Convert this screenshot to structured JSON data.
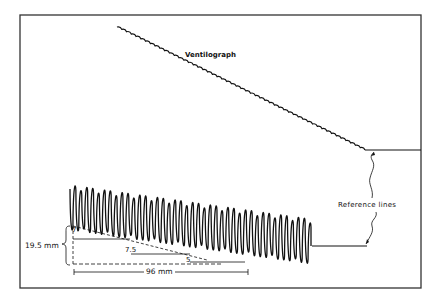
{
  "figure": {
    "labels": {
      "ventilograph": "Ventilograph",
      "reference_lines": "Reference lines",
      "vertical_dimension": "19.5 mm",
      "horizontal_dimension": "96 mm",
      "marker_start": "7",
      "marker_mid": "7.5",
      "marker_end": "5"
    },
    "colors": {
      "ink": "#111111",
      "frame": "#333333",
      "background": "#ffffff"
    }
  }
}
